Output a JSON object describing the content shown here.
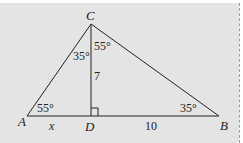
{
  "figure": {
    "type": "right-triangle-altitude",
    "vertices": {
      "A": "A",
      "B": "B",
      "C": "C",
      "D": "D"
    },
    "angles": {
      "A": "55°",
      "B": "35°",
      "ACD": "35°",
      "DCB": "55°"
    },
    "segments": {
      "AD": "x",
      "DB": "10",
      "CD": "7"
    },
    "right_angle_at": "D",
    "colors": {
      "background": "#e4e4e4",
      "stroke": "#222222"
    }
  }
}
